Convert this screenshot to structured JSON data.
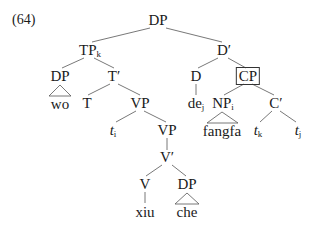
{
  "example_number": "(64)",
  "tree": {
    "root": {
      "label": "DP"
    },
    "tp": {
      "label": "TP",
      "sub": "k"
    },
    "dbar": {
      "label": "D′"
    },
    "dp_left": {
      "label": "DP",
      "leaf": "wo"
    },
    "tbar": {
      "label": "T′"
    },
    "t": {
      "label": "T"
    },
    "vp1": {
      "label": "VP"
    },
    "d": {
      "label": "D"
    },
    "de": {
      "label": "de",
      "sub": "j"
    },
    "cp": {
      "label": "CP",
      "boxed": true
    },
    "np": {
      "label": "NP",
      "sub": "i",
      "leaf": "fangfa"
    },
    "cbar": {
      "label": "C′"
    },
    "trace_k": {
      "label": "t",
      "sub": "k"
    },
    "trace_j": {
      "label": "t",
      "sub": "j"
    },
    "trace_i": {
      "label": "t",
      "sub": "i"
    },
    "vp2": {
      "label": "VP"
    },
    "vbar": {
      "label": "V′"
    },
    "v": {
      "label": "V",
      "leaf": "xiu"
    },
    "dp_obj": {
      "label": "DP",
      "leaf": "che"
    }
  }
}
